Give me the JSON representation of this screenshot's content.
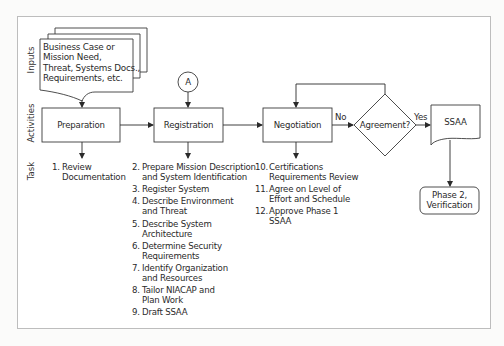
{
  "diagram": {
    "lanes": {
      "inputs": "Inputs",
      "activities": "Activities",
      "task": "Task"
    },
    "input_document": {
      "lines": [
        "Business Case or",
        "Mission Need,",
        "Threat, Systems Docs.,",
        "Requirements, etc."
      ]
    },
    "connector": {
      "label": "A"
    },
    "activities": [
      {
        "id": "preparation",
        "label": "Preparation"
      },
      {
        "id": "registration",
        "label": "Registration"
      },
      {
        "id": "negotiation",
        "label": "Negotiation"
      }
    ],
    "decision": {
      "label": "Agreement?",
      "no_label": "No",
      "yes_label": "Yes"
    },
    "output_document": {
      "label": "SSAA"
    },
    "next_phase": {
      "lines": [
        "Phase 2,",
        "Verification"
      ]
    },
    "tasks": {
      "preparation": [
        {
          "num": "1.",
          "lines": [
            "Review",
            "Documentation"
          ]
        }
      ],
      "registration": [
        {
          "num": "2.",
          "lines": [
            "Prepare Mission Description",
            "and System Identification"
          ]
        },
        {
          "num": "3.",
          "lines": [
            "Register System"
          ]
        },
        {
          "num": "4.",
          "lines": [
            "Describe Environment",
            "and Threat"
          ]
        },
        {
          "num": "5.",
          "lines": [
            "Describe System",
            "Architecture"
          ]
        },
        {
          "num": "6.",
          "lines": [
            "Determine Security",
            "Requirements"
          ]
        },
        {
          "num": "7.",
          "lines": [
            "Identify Organization",
            "and Resources"
          ]
        },
        {
          "num": "8.",
          "lines": [
            "Tailor NIACAP and",
            "Plan Work"
          ]
        },
        {
          "num": "9.",
          "lines": [
            "Draft SSAA"
          ]
        }
      ],
      "negotiation": [
        {
          "num": "10.",
          "lines": [
            "Certifications",
            "Requirements Review"
          ]
        },
        {
          "num": "11.",
          "lines": [
            "Agree on Level of",
            "Effort and Schedule"
          ]
        },
        {
          "num": "12.",
          "lines": [
            "Approve Phase 1",
            "SSAA"
          ]
        }
      ]
    },
    "colors": {
      "stroke": "#3a3a3a",
      "frame": "#bdbdbd",
      "text": "#2a2a2a"
    }
  }
}
